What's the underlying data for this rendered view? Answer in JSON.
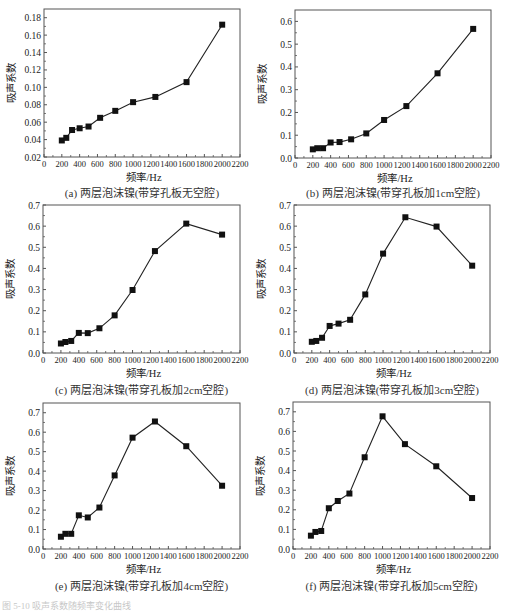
{
  "figure_note": "图 5-10  吸声系数随频率变化曲线",
  "chart_data": [
    {
      "type": "line",
      "id": "a",
      "title": "(a) 两层泡沫镍(带穿孔板无空腔)",
      "xlabel": "频率/Hz",
      "ylabel": "吸声系数",
      "x": [
        200,
        250,
        315,
        400,
        500,
        630,
        800,
        1000,
        1250,
        1600,
        2000
      ],
      "values": [
        0.039,
        0.042,
        0.051,
        0.053,
        0.055,
        0.065,
        0.073,
        0.083,
        0.089,
        0.106,
        0.172
      ],
      "xlim": [
        0,
        2200
      ],
      "ylim": [
        0.02,
        0.19
      ],
      "xticks": [
        0,
        200,
        400,
        600,
        800,
        1000,
        1200,
        1400,
        1600,
        1800,
        2000,
        2200
      ],
      "yticks": [
        0.02,
        0.04,
        0.06,
        0.08,
        0.1,
        0.12,
        0.14,
        0.16,
        0.18
      ],
      "ytick_labels": [
        "0.02",
        "0.04",
        "0.06",
        "0.08",
        "0.10",
        "0.12",
        "0.14",
        "0.16",
        "0.18"
      ],
      "grid": false,
      "marker": "square"
    },
    {
      "type": "line",
      "id": "b",
      "title": "(b) 两层泡沫镍(带穿孔板加1cm空腔)",
      "xlabel": "频率/Hz",
      "ylabel": "吸声系数",
      "x": [
        200,
        250,
        315,
        400,
        500,
        630,
        800,
        1000,
        1250,
        1600,
        2000
      ],
      "values": [
        0.038,
        0.043,
        0.043,
        0.068,
        0.07,
        0.082,
        0.108,
        0.167,
        0.228,
        0.372,
        0.567
      ],
      "xlim": [
        0,
        2200
      ],
      "ylim": [
        0.0,
        0.65
      ],
      "xticks": [
        0,
        200,
        400,
        600,
        800,
        1000,
        1200,
        1400,
        1600,
        1800,
        2000,
        2200
      ],
      "yticks": [
        0.0,
        0.1,
        0.2,
        0.3,
        0.4,
        0.5,
        0.6
      ],
      "ytick_labels": [
        "0.0",
        "0.1",
        "0.2",
        "0.3",
        "0.4",
        "0.5",
        "0.6"
      ],
      "grid": false,
      "marker": "square"
    },
    {
      "type": "line",
      "id": "c",
      "title": "(c) 两层泡沫镍(带穿孔板加2cm空腔)",
      "xlabel": "频率/Hz",
      "ylabel": "吸声系数",
      "x": [
        200,
        250,
        315,
        400,
        500,
        630,
        800,
        1000,
        1250,
        1600,
        2000
      ],
      "values": [
        0.045,
        0.052,
        0.057,
        0.095,
        0.094,
        0.117,
        0.178,
        0.298,
        0.482,
        0.612,
        0.56
      ],
      "xlim": [
        0,
        2200
      ],
      "ylim": [
        0.0,
        0.7
      ],
      "xticks": [
        0,
        200,
        400,
        600,
        800,
        1000,
        1200,
        1400,
        1600,
        1800,
        2000,
        2200
      ],
      "yticks": [
        0.0,
        0.1,
        0.2,
        0.3,
        0.4,
        0.5,
        0.6,
        0.7
      ],
      "ytick_labels": [
        "0.0",
        "0.1",
        "0.2",
        "0.3",
        "0.4",
        "0.5",
        "0.6",
        "0.7"
      ],
      "grid": false,
      "marker": "square"
    },
    {
      "type": "line",
      "id": "d",
      "title": "(d) 两层泡沫镍(带穿孔板加3cm空腔)",
      "xlabel": "频率/Hz",
      "ylabel": "吸声系数",
      "x": [
        200,
        250,
        315,
        400,
        500,
        630,
        800,
        1000,
        1250,
        1600,
        2000
      ],
      "values": [
        0.053,
        0.057,
        0.072,
        0.128,
        0.139,
        0.157,
        0.277,
        0.47,
        0.642,
        0.598,
        0.413
      ],
      "xlim": [
        0,
        2200
      ],
      "ylim": [
        0.0,
        0.7
      ],
      "xticks": [
        0,
        200,
        400,
        600,
        800,
        1000,
        1200,
        1400,
        1600,
        1800,
        2000,
        2200
      ],
      "yticks": [
        0.0,
        0.1,
        0.2,
        0.3,
        0.4,
        0.5,
        0.6,
        0.7
      ],
      "ytick_labels": [
        "0.0",
        "0.1",
        "0.2",
        "0.3",
        "0.4",
        "0.5",
        "0.6",
        "0.7"
      ],
      "grid": false,
      "marker": "square"
    },
    {
      "type": "line",
      "id": "e",
      "title": "(e) 两层泡沫镍(带穿孔板加4cm空腔)",
      "xlabel": "频率/Hz",
      "ylabel": "吸声系数",
      "x": [
        200,
        250,
        315,
        400,
        500,
        630,
        800,
        1000,
        1250,
        1600,
        2000
      ],
      "values": [
        0.063,
        0.078,
        0.078,
        0.173,
        0.162,
        0.213,
        0.378,
        0.572,
        0.655,
        0.528,
        0.325
      ],
      "xlim": [
        0,
        2200
      ],
      "ylim": [
        0.0,
        0.75
      ],
      "xticks": [
        0,
        200,
        400,
        600,
        800,
        1000,
        1200,
        1400,
        1600,
        1800,
        2000,
        2200
      ],
      "yticks": [
        0.0,
        0.1,
        0.2,
        0.3,
        0.4,
        0.5,
        0.6,
        0.7
      ],
      "ytick_labels": [
        "0.0",
        "0.1",
        "0.2",
        "0.3",
        "0.4",
        "0.5",
        "0.6",
        "0.7"
      ],
      "grid": false,
      "marker": "square"
    },
    {
      "type": "line",
      "id": "f",
      "title": "(f) 两层泡沫镍(带穿孔板加5cm空腔)",
      "xlabel": "频率/Hz",
      "ylabel": "吸声系数",
      "x": [
        200,
        250,
        315,
        400,
        500,
        630,
        800,
        1000,
        1250,
        1600,
        2000
      ],
      "values": [
        0.068,
        0.087,
        0.092,
        0.208,
        0.245,
        0.283,
        0.468,
        0.677,
        0.535,
        0.422,
        0.26
      ],
      "xlim": [
        0,
        2200
      ],
      "ylim": [
        0.0,
        0.75
      ],
      "xticks": [
        0,
        200,
        400,
        600,
        800,
        1000,
        1200,
        1400,
        1600,
        1800,
        2000,
        2200
      ],
      "yticks": [
        0.0,
        0.1,
        0.2,
        0.3,
        0.4,
        0.5,
        0.6,
        0.7
      ],
      "ytick_labels": [
        "0.0",
        "0.1",
        "0.2",
        "0.3",
        "0.4",
        "0.5",
        "0.6",
        "0.7"
      ],
      "grid": false,
      "marker": "square"
    }
  ],
  "layout": {
    "panels": [
      {
        "left": 44,
        "top": 9,
        "right": 240,
        "bottom": 157,
        "caption_y": 184
      },
      {
        "left": 295,
        "top": 10,
        "right": 491,
        "bottom": 158,
        "caption_y": 184
      },
      {
        "left": 43,
        "top": 205,
        "right": 240,
        "bottom": 353,
        "caption_y": 381
      },
      {
        "left": 294,
        "top": 205,
        "right": 490,
        "bottom": 353,
        "caption_y": 381
      },
      {
        "left": 43,
        "top": 403,
        "right": 240,
        "bottom": 549,
        "caption_y": 577
      },
      {
        "left": 293,
        "top": 402,
        "right": 490,
        "bottom": 549,
        "caption_y": 577
      }
    ],
    "line_color": "#222222",
    "axis_color": "#555555"
  }
}
